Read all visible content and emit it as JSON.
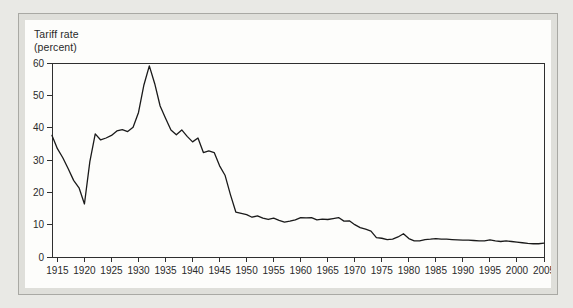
{
  "figure": {
    "page_background_color": "#e9e9e5",
    "frame_band_color": "#dfdfda",
    "frame_border_color": "#a9a9a4",
    "panel_color": "#fdfdfb"
  },
  "chart_data": {
    "type": "line",
    "title": "Tariff rate (percent)",
    "ylabel_line1": "Tariff rate",
    "ylabel_line2": "(percent)",
    "xlabel": "",
    "xlim": [
      1914,
      2005
    ],
    "ylim": [
      0,
      60
    ],
    "yticks": [
      0,
      10,
      20,
      30,
      40,
      50,
      60
    ],
    "xticks": [
      1915,
      1920,
      1925,
      1930,
      1935,
      1940,
      1945,
      1950,
      1955,
      1960,
      1965,
      1970,
      1975,
      1980,
      1985,
      1990,
      1995,
      2000,
      2005
    ],
    "grid": false,
    "legend": "none",
    "frame_color": "#2f2f2f",
    "line_color": "#1a1a1a",
    "x": [
      1914,
      1915,
      1916,
      1917,
      1918,
      1919,
      1920,
      1921,
      1922,
      1923,
      1924,
      1925,
      1926,
      1927,
      1928,
      1929,
      1930,
      1931,
      1932,
      1933,
      1934,
      1935,
      1936,
      1937,
      1938,
      1939,
      1940,
      1941,
      1942,
      1943,
      1944,
      1945,
      1946,
      1947,
      1948,
      1949,
      1950,
      1951,
      1952,
      1953,
      1954,
      1955,
      1956,
      1957,
      1958,
      1959,
      1960,
      1961,
      1962,
      1963,
      1964,
      1965,
      1966,
      1967,
      1968,
      1969,
      1970,
      1971,
      1972,
      1973,
      1974,
      1975,
      1976,
      1977,
      1978,
      1979,
      1980,
      1981,
      1982,
      1983,
      1984,
      1985,
      1986,
      1987,
      1988,
      1989,
      1990,
      1991,
      1992,
      1993,
      1994,
      1995,
      1996,
      1997,
      1998,
      1999,
      2000,
      2001,
      2002,
      2003,
      2004,
      2005
    ],
    "values": [
      37.6,
      33.5,
      30.7,
      27.3,
      23.7,
      21.4,
      16.4,
      29.5,
      38.1,
      36.2,
      36.8,
      37.6,
      39.0,
      39.4,
      38.8,
      40.1,
      44.7,
      53.2,
      59.1,
      53.6,
      46.7,
      42.9,
      39.3,
      37.8,
      39.3,
      37.3,
      35.6,
      36.8,
      32.3,
      32.8,
      32.3,
      28.2,
      25.3,
      19.3,
      13.9,
      13.5,
      13.1,
      12.3,
      12.7,
      12.0,
      11.6,
      12.0,
      11.3,
      10.8,
      11.1,
      11.5,
      12.2,
      12.1,
      12.2,
      11.5,
      11.7,
      11.6,
      11.9,
      12.2,
      11.1,
      11.2,
      10.0,
      9.1,
      8.6,
      8.0,
      6.0,
      5.8,
      5.4,
      5.5,
      6.2,
      7.2,
      5.7,
      5.0,
      5.0,
      5.4,
      5.5,
      5.7,
      5.5,
      5.5,
      5.4,
      5.3,
      5.2,
      5.2,
      5.1,
      5.0,
      5.0,
      5.3,
      5.0,
      4.8,
      5.0,
      4.8,
      4.6,
      4.4,
      4.2,
      4.1,
      4.1,
      4.3
    ]
  }
}
